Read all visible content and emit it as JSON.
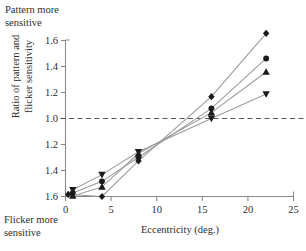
{
  "annotations": {
    "top_left": "Pattern more\nsensitive",
    "bottom_left": "Flicker more\nsensitive"
  },
  "chart_data": {
    "type": "line",
    "title": "",
    "xlabel": "Eccentricity (deg.)",
    "ylabel": "Ratio of pattern and\nflicker sensitivity",
    "xlim": [
      0,
      25
    ],
    "xticks": [
      "0",
      "5",
      "10",
      "15",
      "20",
      "25"
    ],
    "xtick_values": [
      0,
      5,
      10,
      15,
      20,
      25
    ],
    "yticks": [
      "1.6",
      "1.4",
      "1.2",
      "1.0",
      "1.2",
      "1.4",
      "1.6"
    ],
    "ytick_values": [
      1.6,
      1.4,
      1.2,
      1.0,
      0.8333,
      0.7143,
      0.625
    ],
    "y_axis_note": "Reciprocal scale: labels below 1.0 denote 1/ratio",
    "grid": false,
    "legend": false,
    "reference_line": {
      "y": 1.0,
      "style": "dashed",
      "color": "#555555"
    },
    "series": [
      {
        "name": "observer-1",
        "marker": "diamond",
        "color": "#1a1a1a",
        "x": [
          0.3,
          4,
          8,
          16,
          22
        ],
        "y": [
          0.632,
          0.625,
          0.758,
          1.168,
          1.655
        ]
      },
      {
        "name": "observer-2",
        "marker": "circle",
        "color": "#1a1a1a",
        "x": [
          0.8,
          4,
          8,
          16,
          22
        ],
        "y": [
          0.637,
          0.677,
          0.775,
          1.078,
          1.462
        ]
      },
      {
        "name": "observer-3",
        "marker": "triangle-up",
        "color": "#1a1a1a",
        "x": [
          0.8,
          4,
          8,
          16,
          22
        ],
        "y": [
          0.627,
          0.658,
          0.792,
          1.045,
          1.358
        ]
      },
      {
        "name": "observer-4",
        "marker": "triangle-down",
        "color": "#1a1a1a",
        "x": [
          0.8,
          4,
          8,
          16,
          22
        ],
        "y": [
          0.648,
          0.7,
          0.8,
          1.0,
          1.188
        ]
      }
    ]
  },
  "style": {
    "axis_color": "#8a8a8a",
    "marker_color": "#1a1a1a",
    "line_color": "#9a9a9a",
    "text_color": "#2d2d2d"
  }
}
